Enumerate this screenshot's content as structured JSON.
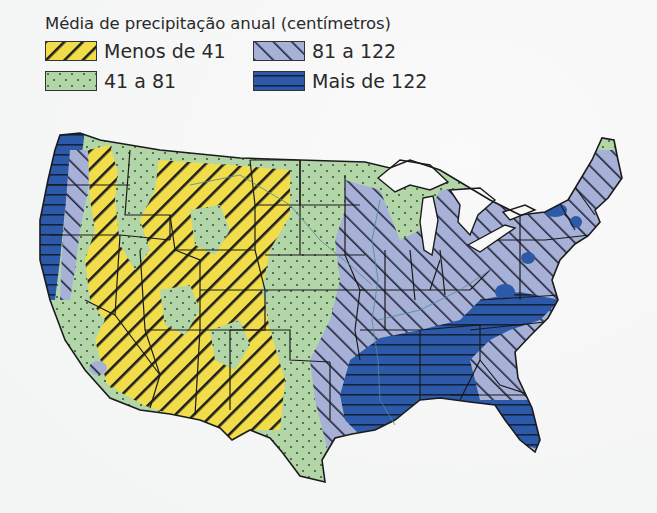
{
  "legend": {
    "title": "Média de precipitação anual (centímetros)",
    "items": [
      {
        "label": "Menos de 41",
        "pattern": "diagonal-hatch-backslash",
        "color": "#f1dc4a"
      },
      {
        "label": "81 a 122",
        "pattern": "diagonal-hatch-slash",
        "color": "#a7b1d8"
      },
      {
        "label": "41 a 81",
        "pattern": "dots",
        "color": "#b3d6a9"
      },
      {
        "label": "Mais de 122",
        "pattern": "horizontal-lines",
        "color": "#2d5aa8"
      }
    ]
  },
  "map": {
    "subject": "Contiguous United States",
    "regions": [
      {
        "class": "Mais de 122",
        "areas": [
          "Pacific Northwest coast",
          "Southeast / Gulf Coast",
          "Florida",
          "Appalachian patches"
        ]
      },
      {
        "class": "81 a 122",
        "areas": [
          "East",
          "Northeast",
          "Midwest east of Mississippi",
          "East Texas"
        ]
      },
      {
        "class": "41 a 81",
        "areas": [
          "Great Plains",
          "Minnesota",
          "Michigan",
          "Central Texas",
          "Mountain patches"
        ]
      },
      {
        "class": "Menos de 41",
        "areas": [
          "Great Basin",
          "Southwest",
          "Montana / Wyoming high plains",
          "West Texas"
        ]
      }
    ]
  },
  "colors": {
    "dry": "#f1dc4a",
    "semi": "#b3d6a9",
    "wet": "#a7b1d8",
    "very_wet": "#2d5aa8",
    "water": "#f8f8f8",
    "border": "#1b1b1b"
  }
}
